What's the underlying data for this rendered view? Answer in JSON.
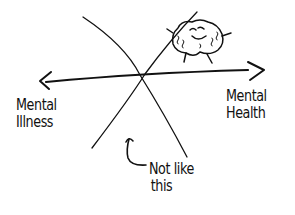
{
  "diagram": {
    "type": "hand-drawn sketch",
    "axis": {
      "left_label_line1": "Mental",
      "left_label_line2": "Illness",
      "right_label_line1": "Mental",
      "right_label_line2": "Health"
    },
    "annotation": {
      "line1": "Not like",
      "line2": "this"
    },
    "icons": {
      "brain": "smiling-brain-icon",
      "pointer": "curved-arrow-up-icon"
    },
    "colors": {
      "ink": "#111111",
      "background": "#ffffff"
    }
  }
}
